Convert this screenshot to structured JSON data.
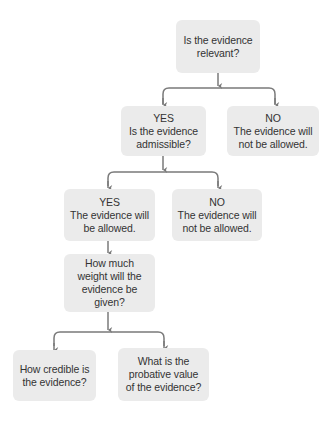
{
  "diagram": {
    "type": "flowchart",
    "colors": {
      "node_fill": "#ebebeb",
      "text": "#333333",
      "connector": "#7a7a7a",
      "background": "#ffffff"
    },
    "nodes": [
      {
        "id": "relevant",
        "lines": [
          "Is the evidence",
          "relevant?"
        ]
      },
      {
        "id": "admissible",
        "lines": [
          "YES",
          "Is the evidence",
          "admissible?"
        ]
      },
      {
        "id": "not-relevant",
        "lines": [
          "NO",
          "The evidence will",
          "not be allowed."
        ]
      },
      {
        "id": "allowed",
        "lines": [
          "YES",
          "The evidence will",
          "be allowed."
        ]
      },
      {
        "id": "not-admissible",
        "lines": [
          "NO",
          "The evidence will",
          "not be allowed."
        ]
      },
      {
        "id": "weight",
        "lines": [
          "How much",
          "weight will the",
          "evidence be",
          "given?"
        ]
      },
      {
        "id": "credible",
        "lines": [
          "How credible is",
          "the evidence?"
        ]
      },
      {
        "id": "probative",
        "lines": [
          "What is the",
          "probative value",
          "of the evidence?"
        ]
      }
    ],
    "edges": [
      {
        "from": "relevant",
        "to": "admissible",
        "label": "YES"
      },
      {
        "from": "relevant",
        "to": "not-relevant",
        "label": "NO"
      },
      {
        "from": "admissible",
        "to": "allowed",
        "label": "YES"
      },
      {
        "from": "admissible",
        "to": "not-admissible",
        "label": "NO"
      },
      {
        "from": "allowed",
        "to": "weight"
      },
      {
        "from": "weight",
        "to": "credible"
      },
      {
        "from": "weight",
        "to": "probative"
      }
    ]
  }
}
